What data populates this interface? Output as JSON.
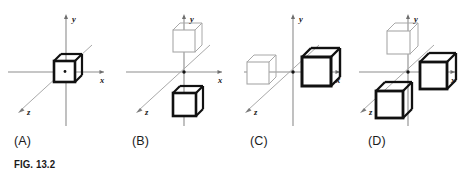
{
  "figure": {
    "caption": "FIG. 13.2",
    "axis_labels": {
      "x": "x",
      "y": "y",
      "z": "z"
    },
    "colors": {
      "axis": "#8d8d8d",
      "cube_dark": "#111111",
      "cube_light": "#a8a8a8",
      "text": "#1b1b1b",
      "background": "#ffffff"
    },
    "panels": [
      {
        "id": "A",
        "label": "(A)",
        "cubes": [
          {
            "name": "cube-origin-dark",
            "style": "dark",
            "size": "small",
            "position": "origin"
          }
        ]
      },
      {
        "id": "B",
        "label": "(B)",
        "cubes": [
          {
            "name": "cube-above-light",
            "style": "light",
            "size": "small",
            "position": "above-origin"
          },
          {
            "name": "cube-below-dark",
            "style": "dark",
            "size": "small",
            "position": "below-origin"
          }
        ]
      },
      {
        "id": "C",
        "label": "(C)",
        "cubes": [
          {
            "name": "cube-left-light",
            "style": "light",
            "size": "medium",
            "position": "negative-x"
          },
          {
            "name": "cube-right-dark",
            "style": "dark",
            "size": "large",
            "position": "positive-x"
          }
        ]
      },
      {
        "id": "D",
        "label": "(D)",
        "cubes": [
          {
            "name": "cube-upper-left-light",
            "style": "light",
            "size": "medium",
            "position": "upper-left"
          },
          {
            "name": "cube-right-dark",
            "style": "dark",
            "size": "large",
            "position": "positive-x"
          },
          {
            "name": "cube-lower-left-dark",
            "style": "dark",
            "size": "large",
            "position": "lower-left"
          }
        ]
      }
    ]
  }
}
